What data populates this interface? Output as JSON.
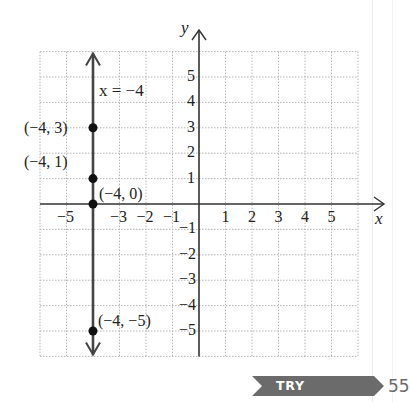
{
  "chart_data": {
    "type": "line",
    "title": "",
    "xlabel": "x",
    "ylabel": "y",
    "xlim": [
      -6,
      6
    ],
    "ylim": [
      -6,
      6
    ],
    "grid": true,
    "x_ticks": [
      "-5",
      "-3",
      "-2",
      "-1",
      "1",
      "2",
      "3",
      "4",
      "5"
    ],
    "y_ticks": [
      "5",
      "4",
      "3",
      "2",
      "1",
      "-1",
      "-2",
      "-3",
      "-4",
      "-5"
    ],
    "series": [
      {
        "name": "x = -4",
        "type": "vertical-line",
        "x": -4,
        "y_range": [
          -6,
          6
        ],
        "arrows": "both"
      }
    ],
    "points": [
      {
        "x": -4,
        "y": 3,
        "label": "(−4, 3)"
      },
      {
        "x": -4,
        "y": 1,
        "label": "(−4, 1)"
      },
      {
        "x": -4,
        "y": 0,
        "label": "(−4, 0)"
      },
      {
        "x": -4,
        "y": -5,
        "label": "(−4, −5)"
      }
    ],
    "annotations": [
      {
        "text": "x = −4",
        "x": -3.7,
        "y": 4.5
      }
    ]
  },
  "labels": {
    "x_axis": "x",
    "y_axis": "y",
    "line_equation": "x = −4",
    "x_ticks": [
      {
        "v": -5,
        "t": "−5"
      },
      {
        "v": -3,
        "t": "−3"
      },
      {
        "v": -2,
        "t": "−2"
      },
      {
        "v": -1,
        "t": "−1"
      },
      {
        "v": 1,
        "t": "1"
      },
      {
        "v": 2,
        "t": "2"
      },
      {
        "v": 3,
        "t": "3"
      },
      {
        "v": 4,
        "t": "4"
      },
      {
        "v": 5,
        "t": "5"
      }
    ],
    "y_ticks": [
      {
        "v": 5,
        "t": "5"
      },
      {
        "v": 4,
        "t": "4"
      },
      {
        "v": 3,
        "t": "3"
      },
      {
        "v": 2,
        "t": "2"
      },
      {
        "v": 1,
        "t": "1"
      },
      {
        "v": -1,
        "t": "−1"
      },
      {
        "v": -2,
        "t": "−2"
      },
      {
        "v": -3,
        "t": "−3"
      },
      {
        "v": -4,
        "t": "−4"
      },
      {
        "v": -5,
        "t": "−5"
      }
    ]
  },
  "footer": {
    "button_label": "TRY EXERCISE",
    "exercise_number": "55",
    "badge_color": "#6b6b6b"
  }
}
